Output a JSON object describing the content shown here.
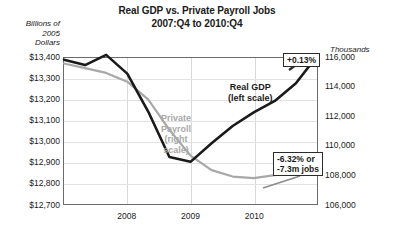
{
  "title": {
    "line1": "Real GDP vs. Private Payroll Jobs",
    "line2": "2007:Q4 to 2010:Q4"
  },
  "left_axis_header": "Billions of\n2005\nDollars",
  "left_axis_header_lines": [
    "Billions of",
    "2005",
    "Dollars"
  ],
  "right_axis_header": "Thousands",
  "annotations": {
    "gdp": "+0.13%",
    "jobs_line1": "-6.32% or",
    "jobs_line2": "-7.3m jobs"
  },
  "series_labels": {
    "gdp_line1": "Real GDP",
    "gdp_line2": "(left scale)",
    "payroll_line1": "Private",
    "payroll_line2": "Payroll",
    "payroll_line3": "(right",
    "payroll_line4": "scale)"
  },
  "colors": {
    "gdp": "#1a1a1a",
    "payroll": "#a8a8a8",
    "frame": "#6b6b6b",
    "grid": "#d9d9d9"
  },
  "chart_data": {
    "type": "line",
    "title": "Real GDP vs. Private Payroll Jobs 2007:Q4 to 2010:Q4",
    "xlabel": "",
    "ylabel": "Billions of 2005 Dollars",
    "y2label": "Thousands",
    "grid": true,
    "legend": "inline-annotations",
    "x": [
      "2007:Q4",
      "2008:Q1",
      "2008:Q2",
      "2008:Q3",
      "2008:Q4",
      "2009:Q1",
      "2009:Q2",
      "2009:Q3",
      "2009:Q4",
      "2010:Q1",
      "2010:Q2",
      "2010:Q3",
      "2010:Q4"
    ],
    "xticks": [
      "2008",
      "2009",
      "2010"
    ],
    "xtick_positions": [
      0.25,
      0.5,
      0.75
    ],
    "ylim": [
      12700,
      13400
    ],
    "yticks": [
      "$12,700",
      "$12,800",
      "$12,900",
      "$13,000",
      "$13,100",
      "$13,200",
      "$13,300",
      "$13,400"
    ],
    "y2lim": [
      106000,
      116000
    ],
    "y2ticks": [
      "106,000",
      "108,000",
      "110,000",
      "112,000",
      "114,000",
      "116,000"
    ],
    "series": [
      {
        "name": "Real GDP (left scale)",
        "axis": "left",
        "color": "#1a1a1a",
        "units": "Billions of 2005 Dollars",
        "values": [
          13392,
          13366,
          13415,
          13325,
          13142,
          12925,
          12902,
          12991,
          13074,
          13139,
          13194,
          13279,
          13409
        ]
      },
      {
        "name": "Private Payroll (right scale)",
        "axis": "right",
        "color": "#a8a8a8",
        "units": "Thousands of jobs",
        "values": [
          115620,
          115310,
          114980,
          114380,
          113150,
          111080,
          109320,
          108320,
          107880,
          107770,
          107980,
          108180,
          108320
        ]
      }
    ],
    "annotations": [
      {
        "text": "+0.13%",
        "refers_to": "Real GDP endpoint 2010:Q4"
      },
      {
        "text": "-6.32% or -7.3m jobs",
        "refers_to": "Private Payroll endpoint 2010:Q4"
      }
    ]
  }
}
